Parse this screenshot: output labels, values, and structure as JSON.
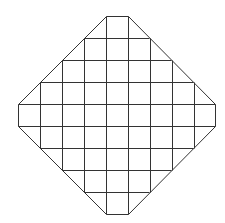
{
  "diagram": {
    "type": "octagonal-grid",
    "background": "#ffffff",
    "stroke_color": "#333333",
    "stroke_width": 1,
    "outline": [
      [
        106,
        16
      ],
      [
        128,
        16
      ],
      [
        215,
        104
      ],
      [
        215,
        126
      ],
      [
        128,
        214
      ],
      [
        106,
        214
      ],
      [
        18,
        126
      ],
      [
        18,
        104
      ]
    ],
    "grid": {
      "columns": 9,
      "rows": 9,
      "x_lines": [
        18,
        40,
        62,
        84,
        106,
        128,
        150,
        172,
        194,
        215
      ],
      "y_lines": [
        16,
        38,
        60,
        82,
        104,
        126,
        148,
        170,
        192,
        214
      ]
    },
    "vertical_segments": [
      {
        "x": 40,
        "y1": 82,
        "y2": 148
      },
      {
        "x": 62,
        "y1": 60,
        "y2": 170
      },
      {
        "x": 84,
        "y1": 38,
        "y2": 192
      },
      {
        "x": 106,
        "y1": 16,
        "y2": 214
      },
      {
        "x": 128,
        "y1": 16,
        "y2": 214
      },
      {
        "x": 150,
        "y1": 38,
        "y2": 192
      },
      {
        "x": 172,
        "y1": 60,
        "y2": 170
      },
      {
        "x": 194,
        "y1": 82,
        "y2": 148
      }
    ],
    "horizontal_segments": [
      {
        "y": 38,
        "x1": 84,
        "x2": 149
      },
      {
        "y": 60,
        "x1": 62,
        "x2": 171
      },
      {
        "y": 82,
        "x1": 40,
        "x2": 193
      },
      {
        "y": 104,
        "x1": 18,
        "x2": 215
      },
      {
        "y": 126,
        "x1": 18,
        "x2": 215
      },
      {
        "y": 148,
        "x1": 40,
        "x2": 193
      },
      {
        "y": 170,
        "x1": 62,
        "x2": 171
      },
      {
        "y": 192,
        "x1": 84,
        "x2": 149
      }
    ]
  }
}
